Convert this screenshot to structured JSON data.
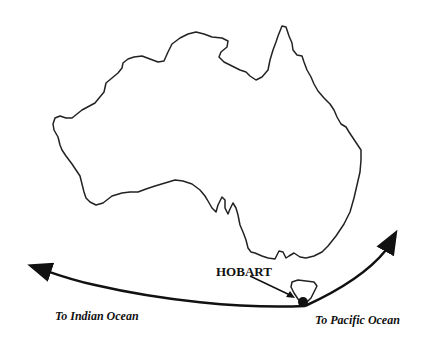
{
  "map": {
    "subject": "Australia outline with route through Hobart",
    "colors": {
      "ink": "#111111",
      "background": "#ffffff"
    },
    "labels": {
      "city": "HOBART",
      "west_destination": "To Indian Ocean",
      "east_destination": "To Pacific Ocean"
    },
    "markers": [
      {
        "name": "Hobart",
        "type": "city-dot"
      }
    ],
    "route": {
      "from": "To Indian Ocean",
      "via": "HOBART",
      "to": "To Pacific Ocean"
    }
  }
}
